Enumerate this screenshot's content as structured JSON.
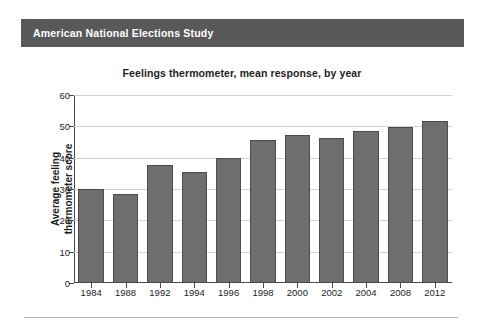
{
  "banner": {
    "title": "American National Elections Study"
  },
  "chart_data": {
    "type": "bar",
    "title": "Feelings thermometer, mean response, by year",
    "xlabel": "",
    "ylabel": "Average feeling thermometer score",
    "ylabel_lines": [
      "Average feeling",
      "thermometer score"
    ],
    "categories": [
      "1984",
      "1988",
      "1992",
      "1994",
      "1996",
      "1998",
      "2000",
      "2002",
      "2004",
      "2008",
      "2012"
    ],
    "values": [
      30,
      28.5,
      37.8,
      35.5,
      40,
      45.5,
      47.3,
      46.3,
      48.5,
      49.8,
      51.7
    ],
    "ylim": [
      0,
      60
    ],
    "yticks": [
      0,
      10,
      20,
      30,
      40,
      50,
      60
    ],
    "ytick_labels": [
      "0",
      "10",
      "20",
      "30",
      "40",
      "50",
      "60"
    ],
    "grid": true,
    "legend": "none",
    "bar_color": "#6e6e6e",
    "bar_edge_color": "#4c4c4c"
  },
  "colors": {
    "banner_background": "#595959",
    "banner_text": "#ffffff",
    "axis": "#4a4a4a",
    "gridline": "#d2d2d2",
    "page_background": "#ffffff",
    "rule": "#b5b5b5"
  }
}
